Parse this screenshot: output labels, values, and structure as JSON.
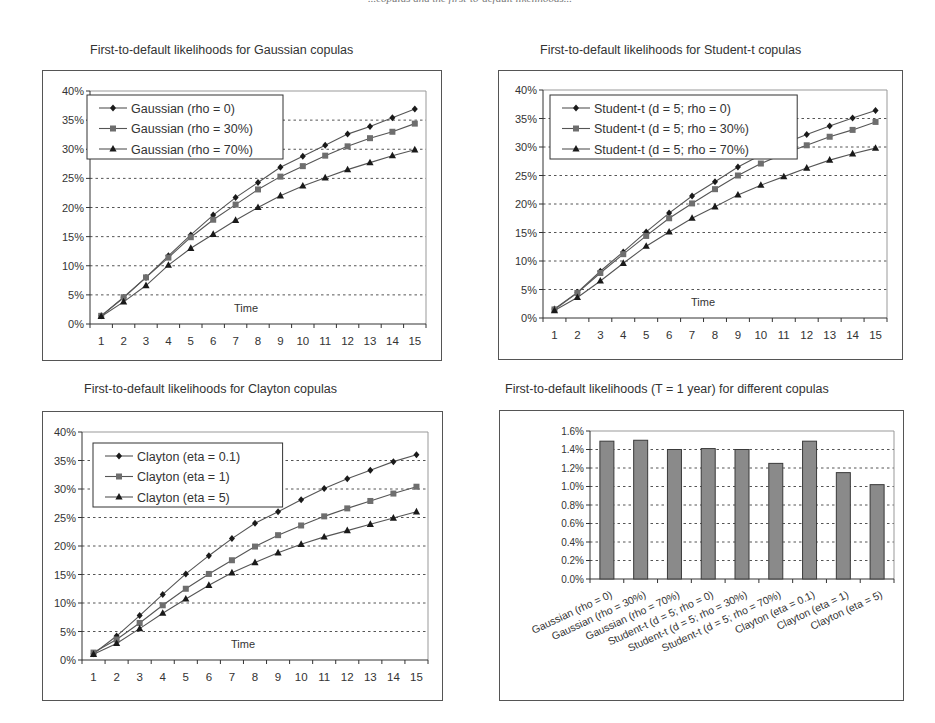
{
  "page": {
    "header_fragment": "...copulas and the first-to-default likelihoods..."
  },
  "chart_data": [
    {
      "id": "gaussian",
      "type": "line",
      "title": "First-to-default likelihoods for Gaussian copulas",
      "xlabel": "Time",
      "ylabel": "",
      "x": [
        1,
        2,
        3,
        4,
        5,
        6,
        7,
        8,
        9,
        10,
        11,
        12,
        13,
        14,
        15
      ],
      "yticks": [
        "0%",
        "5%",
        "10%",
        "15%",
        "20%",
        "25%",
        "30%",
        "35%",
        "40%"
      ],
      "ylim": [
        0,
        40
      ],
      "grid": "horizontal dotted",
      "legend_position": "upper-left inside",
      "series": [
        {
          "name": "Gaussian (rho = 0)",
          "marker": "diamond",
          "values": [
            1.4,
            4.5,
            8.0,
            11.7,
            15.3,
            18.7,
            21.7,
            24.3,
            26.9,
            28.8,
            30.7,
            32.6,
            33.9,
            35.4,
            36.9
          ]
        },
        {
          "name": "Gaussian (rho = 30%)",
          "marker": "square",
          "values": [
            1.4,
            4.6,
            8.0,
            11.4,
            14.9,
            17.9,
            20.5,
            23.1,
            25.3,
            27.1,
            28.9,
            30.5,
            31.9,
            33.0,
            34.4
          ]
        },
        {
          "name": "Gaussian (rho = 70%)",
          "marker": "triangle",
          "values": [
            1.3,
            3.8,
            6.6,
            10.1,
            13.0,
            15.4,
            17.8,
            20.0,
            22.0,
            23.7,
            25.1,
            26.5,
            27.7,
            28.9,
            29.9
          ]
        }
      ]
    },
    {
      "id": "student",
      "type": "line",
      "title": "First-to-default likelihoods for Student-t copulas",
      "xlabel": "Time",
      "ylabel": "",
      "x": [
        1,
        2,
        3,
        4,
        5,
        6,
        7,
        8,
        9,
        10,
        11,
        12,
        13,
        14,
        15
      ],
      "yticks": [
        "0%",
        "5%",
        "10%",
        "15%",
        "20%",
        "25%",
        "30%",
        "35%",
        "40%"
      ],
      "ylim": [
        0,
        40
      ],
      "grid": "horizontal dotted",
      "legend_position": "upper-left inside",
      "series": [
        {
          "name": "Student-t (d = 5; rho = 0)",
          "marker": "diamond",
          "values": [
            1.6,
            4.5,
            8.2,
            11.6,
            15.1,
            18.4,
            21.4,
            23.9,
            26.5,
            28.6,
            30.6,
            32.2,
            33.7,
            35.1,
            36.4
          ]
        },
        {
          "name": "Student-t (d = 5; rho = 30%)",
          "marker": "square",
          "values": [
            1.5,
            4.4,
            7.9,
            11.2,
            14.4,
            17.5,
            20.1,
            22.6,
            25.0,
            27.1,
            28.8,
            30.3,
            31.8,
            33.0,
            34.4
          ]
        },
        {
          "name": "Student-t (d = 5; rho = 70%)",
          "marker": "triangle",
          "values": [
            1.3,
            3.6,
            6.5,
            9.6,
            12.6,
            15.1,
            17.5,
            19.5,
            21.6,
            23.3,
            24.8,
            26.3,
            27.7,
            28.8,
            29.8
          ]
        }
      ]
    },
    {
      "id": "clayton",
      "type": "line",
      "title": "First-to-default likelihoods for Clayton copulas",
      "xlabel": "Time",
      "ylabel": "",
      "x": [
        1,
        2,
        3,
        4,
        5,
        6,
        7,
        8,
        9,
        10,
        11,
        12,
        13,
        14,
        15
      ],
      "yticks": [
        "0%",
        "5%",
        "10%",
        "15%",
        "20%",
        "25%",
        "30%",
        "35%",
        "40%"
      ],
      "ylim": [
        0,
        40
      ],
      "grid": "horizontal dotted",
      "legend_position": "upper-left inside",
      "series": [
        {
          "name": "Clayton (eta = 0.1)",
          "marker": "diamond",
          "values": [
            1.1,
            4.2,
            7.8,
            11.5,
            15.1,
            18.3,
            21.3,
            24.0,
            26.0,
            28.1,
            30.1,
            31.8,
            33.3,
            34.8,
            36.0
          ]
        },
        {
          "name": "Clayton (eta = 1)",
          "marker": "square",
          "values": [
            1.3,
            3.6,
            6.5,
            9.6,
            12.5,
            15.1,
            17.5,
            19.9,
            21.9,
            23.6,
            25.2,
            26.6,
            27.9,
            29.2,
            30.4
          ]
        },
        {
          "name": "Clayton (eta = 5)",
          "marker": "triangle",
          "values": [
            1.0,
            2.9,
            5.5,
            8.2,
            10.7,
            13.1,
            15.3,
            17.1,
            18.8,
            20.3,
            21.6,
            22.7,
            23.8,
            24.9,
            26.0
          ]
        }
      ]
    },
    {
      "id": "bars",
      "type": "bar",
      "title": "First-to-default likelihoods (T = 1 year) for different copulas",
      "xlabel": "",
      "ylabel": "",
      "categories": [
        "Gaussian (rho = 0)",
        "Gaussian (rho = 30%)",
        "Gaussian (rho = 70%)",
        "Student-t (d = 5; rho = 0)",
        "Student-t (d = 5; rho = 30%)",
        "Student-t (d = 5; rho = 70%)",
        "Clayton (eta = 0.1)",
        "Clayton (eta = 1)",
        "Clayton (eta = 5)"
      ],
      "values": [
        1.49,
        1.5,
        1.4,
        1.41,
        1.4,
        1.25,
        1.49,
        1.15,
        1.02
      ],
      "yticks": [
        "0.0%",
        "0.2%",
        "0.4%",
        "0.6%",
        "0.8%",
        "1.0%",
        "1.2%",
        "1.4%",
        "1.6%"
      ],
      "ylim": [
        0,
        1.6
      ],
      "grid": "horizontal dotted",
      "bar_color": "#8a8a8a",
      "bar_border": "#3a3a3a"
    }
  ],
  "colors": {
    "series": [
      "#1a1a1a",
      "#6e6e6e",
      "#1a1a1a"
    ],
    "line": "#555555",
    "grid": "#555555",
    "frame": "#555555"
  }
}
